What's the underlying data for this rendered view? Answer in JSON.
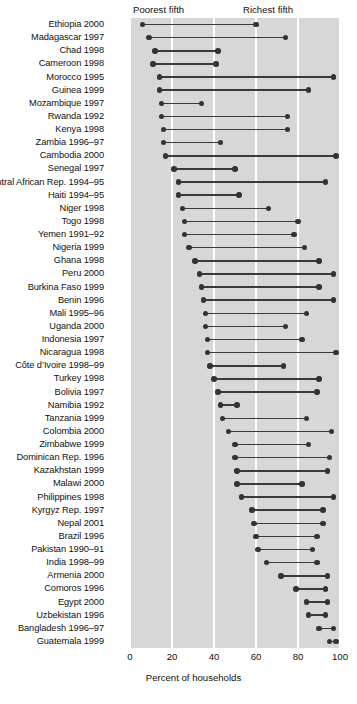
{
  "chart_data": {
    "type": "scatter",
    "subtype": "dumbbell-range-plot",
    "title": "",
    "xlabel": "Percent of households",
    "ylabel": "",
    "xlim": [
      0,
      100
    ],
    "xticks": [
      0,
      20,
      40,
      60,
      80,
      100
    ],
    "xtick_labels": [
      "0",
      "20",
      "40",
      "60",
      "80",
      "100"
    ],
    "grid": "vertical-white-gridlines",
    "legend_position": "inside-top",
    "annotations": [
      {
        "name": "poorest-fifth-note",
        "text": "Poorest fifth"
      },
      {
        "name": "richest-fifth-note",
        "text": "Richest fifth"
      }
    ],
    "series": [
      {
        "name": "Poorest fifth",
        "color": "#333333"
      },
      {
        "name": "Richest fifth",
        "color": "#333333"
      }
    ],
    "categories": [
      "Ethiopia 2000",
      "Madagascar 1997",
      "Chad 1998",
      "Cameroon 1998",
      "Morocco 1995",
      "Guinea 1999",
      "Mozambique 1997",
      "Rwanda 1992",
      "Kenya 1998",
      "Zambia 1996–97",
      "Cambodia 2000",
      "Senegal 1997",
      "Central African Rep. 1994–95",
      "Haiti 1994–95",
      "Niger 1998",
      "Togo 1998",
      "Yemen 1991–92",
      "Nigeria 1999",
      "Ghana 1998",
      "Peru 2000",
      "Burkina Faso 1999",
      "Benin 1996",
      "Mali 1995–96",
      "Uganda 2000",
      "Indonesia 1997",
      "Nicaragua 1998",
      "Côte d’Ivoire 1998–99",
      "Turkey 1998",
      "Bolivia 1997",
      "Namibia 1992",
      "Tanzania 1999",
      "Colombia 2000",
      "Zimbabwe 1999",
      "Dominican Rep. 1996",
      "Kazakhstan 1999",
      "Malawi 2000",
      "Philippines 1998",
      "Kyrgyz Rep. 1997",
      "Nepal 2001",
      "Brazil 1996",
      "Pakistan 1990–91",
      "India 1998–99",
      "Armenia 2000",
      "Comoros 1996",
      "Egypt 2000",
      "Uzbekistan 1996",
      "Bangladesh 1996–97",
      "Guatemala 1999"
    ],
    "rows": [
      {
        "label": "Ethiopia 2000",
        "poorest": 6,
        "richest": 60
      },
      {
        "label": "Madagascar 1997",
        "poorest": 9,
        "richest": 74
      },
      {
        "label": "Chad 1998",
        "poorest": 12,
        "richest": 42
      },
      {
        "label": "Cameroon 1998",
        "poorest": 11,
        "richest": 41
      },
      {
        "label": "Morocco 1995",
        "poorest": 14,
        "richest": 97
      },
      {
        "label": "Guinea 1999",
        "poorest": 14,
        "richest": 85
      },
      {
        "label": "Mozambique 1997",
        "poorest": 15,
        "richest": 34
      },
      {
        "label": "Rwanda 1992",
        "poorest": 15,
        "richest": 75
      },
      {
        "label": "Kenya 1998",
        "poorest": 16,
        "richest": 75
      },
      {
        "label": "Zambia 1996–97",
        "poorest": 16,
        "richest": 43
      },
      {
        "label": "Cambodia 2000",
        "poorest": 17,
        "richest": 98
      },
      {
        "label": "Senegal 1997",
        "poorest": 21,
        "richest": 50
      },
      {
        "label": "Central African Rep. 1994–95",
        "poorest": 23,
        "richest": 93
      },
      {
        "label": "Haiti 1994–95",
        "poorest": 23,
        "richest": 52
      },
      {
        "label": "Niger 1998",
        "poorest": 25,
        "richest": 66
      },
      {
        "label": "Togo 1998",
        "poorest": 26,
        "richest": 80
      },
      {
        "label": "Yemen 1991–92",
        "poorest": 26,
        "richest": 78
      },
      {
        "label": "Nigeria 1999",
        "poorest": 28,
        "richest": 83
      },
      {
        "label": "Ghana 1998",
        "poorest": 31,
        "richest": 90
      },
      {
        "label": "Peru 2000",
        "poorest": 33,
        "richest": 97
      },
      {
        "label": "Burkina Faso 1999",
        "poorest": 34,
        "richest": 90
      },
      {
        "label": "Benin 1996",
        "poorest": 35,
        "richest": 97
      },
      {
        "label": "Mali 1995–96",
        "poorest": 36,
        "richest": 84
      },
      {
        "label": "Uganda 2000",
        "poorest": 36,
        "richest": 74
      },
      {
        "label": "Indonesia 1997",
        "poorest": 37,
        "richest": 82
      },
      {
        "label": "Nicaragua 1998",
        "poorest": 37,
        "richest": 98
      },
      {
        "label": "Côte d’Ivoire 1998–99",
        "poorest": 38,
        "richest": 73
      },
      {
        "label": "Turkey 1998",
        "poorest": 40,
        "richest": 90
      },
      {
        "label": "Bolivia 1997",
        "poorest": 42,
        "richest": 89
      },
      {
        "label": "Namibia 1992",
        "poorest": 43,
        "richest": 51
      },
      {
        "label": "Tanzania 1999",
        "poorest": 44,
        "richest": 84
      },
      {
        "label": "Colombia 2000",
        "poorest": 47,
        "richest": 96
      },
      {
        "label": "Zimbabwe 1999",
        "poorest": 50,
        "richest": 85
      },
      {
        "label": "Dominican Rep. 1996",
        "poorest": 50,
        "richest": 95
      },
      {
        "label": "Kazakhstan 1999",
        "poorest": 51,
        "richest": 94
      },
      {
        "label": "Malawi 2000",
        "poorest": 51,
        "richest": 82
      },
      {
        "label": "Philippines 1998",
        "poorest": 53,
        "richest": 97
      },
      {
        "label": "Kyrgyz Rep. 1997",
        "poorest": 58,
        "richest": 92
      },
      {
        "label": "Nepal 2001",
        "poorest": 59,
        "richest": 92
      },
      {
        "label": "Brazil 1996",
        "poorest": 60,
        "richest": 89
      },
      {
        "label": "Pakistan 1990–91",
        "poorest": 61,
        "richest": 87
      },
      {
        "label": "India 1998–99",
        "poorest": 65,
        "richest": 89
      },
      {
        "label": "Armenia 2000",
        "poorest": 72,
        "richest": 94
      },
      {
        "label": "Comoros 1996",
        "poorest": 79,
        "richest": 93
      },
      {
        "label": "Egypt 2000",
        "poorest": 84,
        "richest": 94
      },
      {
        "label": "Uzbekistan 1996",
        "poorest": 85,
        "richest": 93
      },
      {
        "label": "Bangladesh 1996–97",
        "poorest": 90,
        "richest": 97
      },
      {
        "label": "Guatemala 1999",
        "poorest": 95,
        "richest": 98
      }
    ]
  }
}
